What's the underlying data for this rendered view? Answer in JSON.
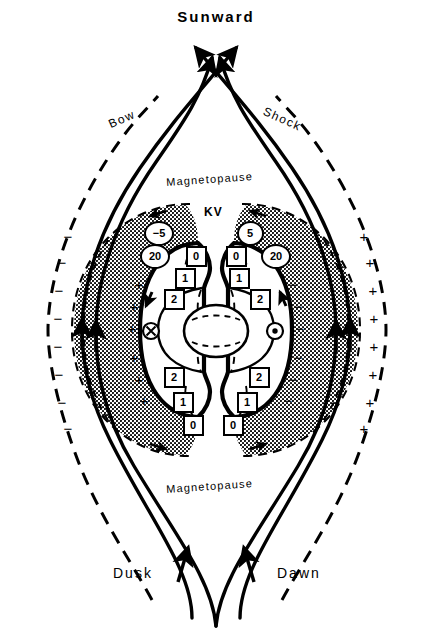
{
  "figure": {
    "kind": "magnetosphere-convection-diagram",
    "width": 432,
    "height": 628,
    "background": "#ffffff",
    "ink": "#000000"
  },
  "labels": {
    "sunward": "Sunward",
    "dusk": "Dusk",
    "dawn": "Dawn",
    "bow": "Bow",
    "shock": "Shock",
    "magnetopause_top": "Magnetopause",
    "magnetopause_bottom": "Magnetopause",
    "kv": "KV"
  },
  "potential_markers": {
    "circled": [
      {
        "text": "−5",
        "x": 156,
        "y": 231,
        "side": "dusk"
      },
      {
        "text": "5",
        "x": 247,
        "y": 231,
        "side": "dawn"
      },
      {
        "text": "20",
        "x": 152,
        "y": 254,
        "side": "dusk"
      },
      {
        "text": "20",
        "x": 273,
        "y": 254,
        "side": "dawn"
      }
    ],
    "boxed": [
      {
        "text": "0",
        "x": 194,
        "y": 254,
        "side": "dusk"
      },
      {
        "text": "0",
        "x": 234,
        "y": 254,
        "side": "dawn"
      },
      {
        "text": "1",
        "x": 183,
        "y": 276,
        "side": "dusk"
      },
      {
        "text": "1",
        "x": 237,
        "y": 276,
        "side": "dawn"
      },
      {
        "text": "2",
        "x": 172,
        "y": 297,
        "side": "dusk"
      },
      {
        "text": "2",
        "x": 258,
        "y": 297,
        "side": "dawn"
      },
      {
        "text": "2",
        "x": 172,
        "y": 375,
        "side": "dusk"
      },
      {
        "text": "2",
        "x": 257,
        "y": 375,
        "side": "dawn"
      },
      {
        "text": "1",
        "x": 181,
        "y": 400,
        "side": "dusk"
      },
      {
        "text": "1",
        "x": 245,
        "y": 400,
        "side": "dawn"
      },
      {
        "text": "0",
        "x": 191,
        "y": 423,
        "side": "dusk"
      },
      {
        "text": "0",
        "x": 231,
        "y": 423,
        "side": "dawn"
      }
    ]
  },
  "field_symbols": [
    {
      "name": "into-page",
      "glyph": "⊗",
      "x": 151,
      "y": 331,
      "side": "dusk"
    },
    {
      "name": "out-of-page",
      "glyph": "⊙",
      "x": 275,
      "y": 331,
      "side": "dawn"
    }
  ],
  "charge_signs": {
    "dusk_outer_minus_count": 8,
    "dusk_inner_plus_count": 6,
    "dawn_outer_plus_count": 8,
    "dawn_inner_minus_count": 6,
    "minus": "−",
    "plus": "+"
  },
  "flow": {
    "sunward_streamlines": 4,
    "antisunward_streamlines": 4,
    "description": "Solar-wind streamlines flow around the magnetopause and cross at the sunward and antisunward stagnation points."
  }
}
